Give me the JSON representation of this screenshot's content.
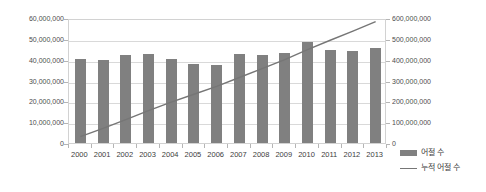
{
  "chart_data": {
    "type": "bar",
    "title": "",
    "xlabel": "",
    "ylabel": "",
    "categories": [
      "2000",
      "2001",
      "2002",
      "2003",
      "2004",
      "2005",
      "2006",
      "2007",
      "2008",
      "2009",
      "2010",
      "2011",
      "2012",
      "2013"
    ],
    "series": [
      {
        "name": "어절 수",
        "axis": "left",
        "type": "bar",
        "color": "#808080",
        "values": [
          40200000,
          39700000,
          42300000,
          42900000,
          40500000,
          38100000,
          37500000,
          42900000,
          42400000,
          43200000,
          48500000,
          44700000,
          44000000,
          45500000
        ]
      },
      {
        "name": "누적 어절 수",
        "axis": "right",
        "type": "line",
        "color": "#767676",
        "values": [
          40200000,
          79900000,
          122200000,
          165100000,
          205600000,
          243700000,
          281200000,
          324100000,
          366500000,
          409700000,
          458200000,
          502900000,
          546900000,
          592400000
        ]
      }
    ],
    "left_axis": {
      "min": 0,
      "max": 60000000,
      "step": 10000000,
      "ticks": [
        "0",
        "10,000,000",
        "20,000,000",
        "30,000,000",
        "40,000,000",
        "50,000,000",
        "60,000,000"
      ]
    },
    "right_axis": {
      "min": 0,
      "max": 600000000,
      "step": 100000000,
      "ticks": [
        "0",
        "100,000,000",
        "200,000,000",
        "300,000,000",
        "400,000,000",
        "500,000,000",
        "600,000,000"
      ]
    },
    "grid": true,
    "legend_position": "right"
  },
  "legend": {
    "items": [
      {
        "label": "어절 수",
        "marker": "bar-swatch"
      },
      {
        "label": "누적 어절 수",
        "marker": "line-swatch"
      }
    ]
  }
}
